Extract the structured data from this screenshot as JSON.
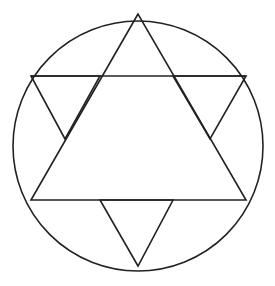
{
  "diagram": {
    "type": "geometric-figure",
    "stroke_color": "#222222",
    "background": "#ffffff",
    "circle": {
      "cx": 138,
      "cy": 146,
      "r": 125
    },
    "large_triangle": {
      "points": "138,14 31,200 246,200"
    },
    "top_line": {
      "x1": 31,
      "y1": 76,
      "x2": 246,
      "y2": 76
    },
    "small_triangles": [
      {
        "name": "left",
        "points": "31,76 100,76 65,139"
      },
      {
        "name": "right",
        "points": "173,76 246,76 210,139"
      },
      {
        "name": "bottom",
        "points": "100,200 173,200 138,266"
      }
    ]
  }
}
